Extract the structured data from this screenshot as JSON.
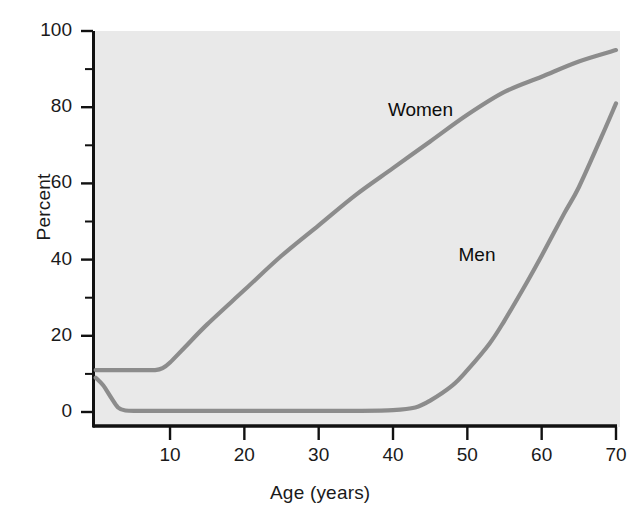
{
  "chart_data": {
    "type": "line",
    "title": "",
    "xlabel": "Age (years)",
    "ylabel": "Percent",
    "xlim": [
      0,
      70
    ],
    "ylim": [
      0,
      100
    ],
    "grid": false,
    "legend_position": "inline-annotations",
    "xticks": [
      {
        "value": 10,
        "label": "10"
      },
      {
        "value": 20,
        "label": "20"
      },
      {
        "value": 30,
        "label": "30"
      },
      {
        "value": 40,
        "label": "40"
      },
      {
        "value": 50,
        "label": "50"
      },
      {
        "value": 60,
        "label": "60"
      },
      {
        "value": 70,
        "label": "70"
      }
    ],
    "xminorticks": [
      5,
      15,
      25,
      35,
      45,
      55,
      65
    ],
    "yticks": [
      {
        "value": 0,
        "label": "0"
      },
      {
        "value": 20,
        "label": "20"
      },
      {
        "value": 40,
        "label": "40"
      },
      {
        "value": 60,
        "label": "60"
      },
      {
        "value": 80,
        "label": "80"
      },
      {
        "value": 100,
        "label": "100"
      }
    ],
    "yminorticks": [
      10,
      30,
      50,
      70,
      90
    ],
    "series": [
      {
        "name": "Women",
        "color": "#8c8c8c",
        "annotation": {
          "text": "Women",
          "x": 45.5,
          "y": 79
        },
        "x": [
          0,
          2,
          4,
          6,
          8,
          9,
          10,
          12,
          15,
          20,
          25,
          30,
          35,
          40,
          45,
          50,
          55,
          60,
          65,
          70
        ],
        "values": [
          11,
          11,
          11,
          11,
          11,
          11.5,
          13,
          17,
          23,
          32,
          41,
          49,
          57,
          64,
          71,
          78,
          84,
          88,
          92,
          95
        ]
      },
      {
        "name": "Men",
        "color": "#8c8c8c",
        "annotation": {
          "text": "Men",
          "x": 55,
          "y": 41
        },
        "x": [
          0,
          1,
          2,
          3,
          4,
          6,
          10,
          15,
          20,
          25,
          30,
          35,
          40,
          43,
          45,
          48,
          50,
          53,
          55,
          58,
          60,
          63,
          65,
          68,
          70
        ],
        "values": [
          9,
          7,
          4,
          1.2,
          0.4,
          0.3,
          0.3,
          0.3,
          0.3,
          0.3,
          0.3,
          0.3,
          0.5,
          1.2,
          3,
          7,
          11,
          18,
          24,
          34,
          41,
          52,
          59,
          72,
          81
        ]
      }
    ]
  },
  "plot": {
    "background_color": "#e9e9e9",
    "axis_color": "#111111",
    "text_color": "#1a1a1a"
  }
}
